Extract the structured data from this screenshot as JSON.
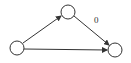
{
  "diagram": {
    "type": "directed-graph",
    "nodes": [
      {
        "id": "left",
        "cx": 17,
        "cy": 48,
        "r": 7
      },
      {
        "id": "top",
        "cx": 68,
        "cy": 12,
        "r": 7
      },
      {
        "id": "right",
        "cx": 115,
        "cy": 50,
        "r": 7
      }
    ],
    "edges": [
      {
        "from": "left",
        "to": "top",
        "label": ""
      },
      {
        "from": "top",
        "to": "right",
        "label": "0"
      },
      {
        "from": "left",
        "to": "right",
        "label": ""
      }
    ],
    "edge_label_top_right": "0",
    "colors": {
      "stroke": "#333333",
      "background": "#ffffff"
    }
  }
}
